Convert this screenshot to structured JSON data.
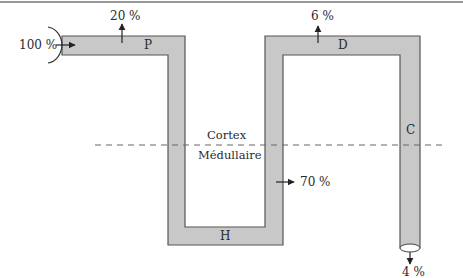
{
  "diagram": {
    "segments": {
      "proximal": "P",
      "henle": "H",
      "distal": "D",
      "collecting": "C"
    },
    "zones": {
      "upper": "Cortex",
      "lower": "Médullaire"
    },
    "flows": {
      "input": "100 %",
      "proximal_out": "20 %",
      "henle_out": "70 %",
      "distal_out": "6 %",
      "final_out": "4 %"
    },
    "colors": {
      "tube_fill": "#c8c8c8",
      "tube_stroke": "#555555",
      "dash": "#666666"
    }
  }
}
